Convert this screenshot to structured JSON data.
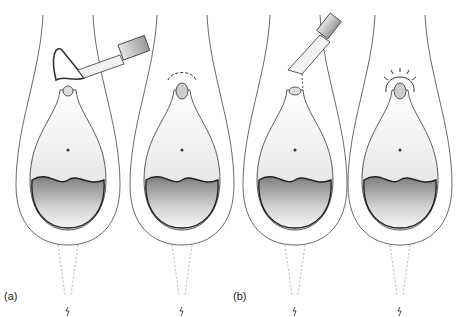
{
  "figure": {
    "panels": [
      {
        "id": "a",
        "label": "(a)",
        "views": [
          "instrument-applied",
          "sutures-placed"
        ]
      },
      {
        "id": "b",
        "label": "(b)",
        "views": [
          "instrument-applied",
          "sutures-placed"
        ]
      }
    ]
  },
  "colors": {
    "outline": "#333333",
    "fill_light": "#f2f2f2",
    "fill_dark": "#8a8a8a",
    "instrument": "#bdbdbd"
  }
}
